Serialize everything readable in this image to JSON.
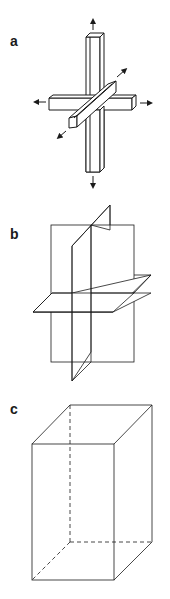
{
  "panels": [
    {
      "label": "a",
      "description": "Three orthogonal bars with bidirectional arrows along each axis"
    },
    {
      "label": "b",
      "description": "Three orthogonal intersecting planes"
    },
    {
      "label": "c",
      "description": "Rectangular box (cuboid) with hidden edges dashed"
    }
  ],
  "colors": {
    "stroke": "#1a1a1a",
    "background": "#ffffff"
  }
}
